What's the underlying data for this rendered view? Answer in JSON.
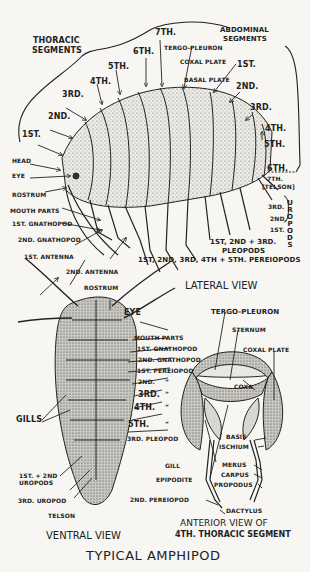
{
  "title": "TYPICAL AMPHIPOD",
  "lateral_view": {
    "caption": "LATERAL VIEW",
    "thoracic_header": [
      "THORACIC",
      "SEGMENTS"
    ],
    "abdominal_header": [
      "ABDOMINAL",
      "SEGMENTS"
    ],
    "thoracic_segments": [
      "1ST.",
      "2ND.",
      "3RD.",
      "4TH.",
      "5TH.",
      "6TH.",
      "7TH."
    ],
    "abdominal_segments": [
      "1ST.",
      "2ND.",
      "3RD.",
      "4TH.",
      "5TH.",
      "6TH.",
      "7TH."
    ],
    "telson_label": "[TELSON]",
    "plates": [
      "TERGO-PLEURON",
      "COXAL PLATE",
      "BASAL PLATE"
    ],
    "head_labels": [
      "HEAD",
      "EYE",
      "ROSTRUM",
      "MOUTH PARTS",
      "1ST. GNATHOPOD",
      "2ND. GNATHOPOD",
      "1ST. ANTENNA",
      "2ND. ANTENNA"
    ],
    "uropods": [
      "3RD.",
      "2ND.",
      "1ST."
    ],
    "uropods_label": "UROPODS",
    "pleopods_label": [
      "1ST, 2ND + 3RD.",
      "PLEOPODS"
    ],
    "pereiopods_label": "1ST, 2ND, 3RD, 4TH + 5TH. PEREIOPODS"
  },
  "ventral_view": {
    "caption": "VENTRAL VIEW",
    "labels": {
      "rostrum": "ROSTRUM",
      "eye": "EYE",
      "mouth_parts": "MOUTH PARTS",
      "gnathopod_1": "1ST. GNATHOPOD",
      "gnathopod_2": "2ND. GNATHOPOD",
      "pereiopod_1": "1ST. PEREIOPOD",
      "pereiopod_2": "2ND.",
      "pereiopod_3": "3RD.",
      "pereiopod_4": "4TH.",
      "pereiopod_5": "5TH.",
      "ditto": "”",
      "pleopod_3": "3RD. PLEOPOD",
      "gills": "GILLS",
      "uropods_12": [
        "1ST. + 2ND",
        "UROPODS"
      ],
      "uropod_3": "3RD. UROPOD",
      "telson": "TELSON"
    }
  },
  "anterior_view": {
    "caption": [
      "ANTERIOR VIEW OF",
      "4TH. THORACIC SEGMENT"
    ],
    "labels": {
      "tergo_pleuron": "TERGO-PLEURON",
      "sternum": "STERNUM",
      "coxal_plate": "COXAL PLATE",
      "coxa": "COXA",
      "basis": "BASIS",
      "ischium": "ISCHIUM",
      "gill": "GILL",
      "epipodite": "EPIPODITE",
      "merus": "MERUS",
      "carpus": "CARPUS",
      "propodus": "PROPODUS",
      "pereiopod_2": "2ND. PEREIOPOD",
      "dactylus": "DACTYLUS"
    }
  }
}
